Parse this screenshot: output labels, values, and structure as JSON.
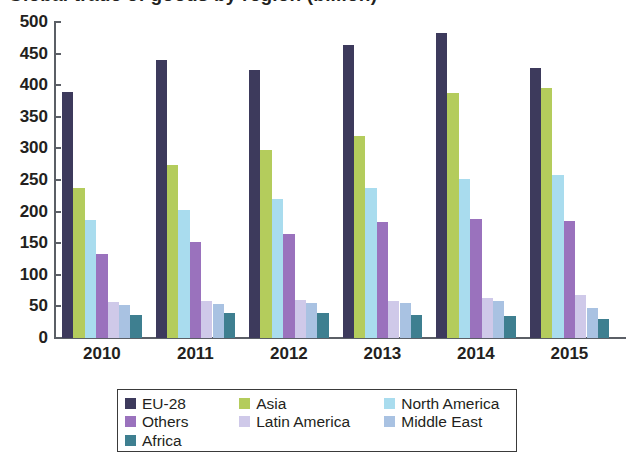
{
  "chart_data": {
    "type": "bar",
    "title": "Global trade of goods by region (billion)",
    "subtitle": "",
    "xlabel": "",
    "ylabel": "",
    "categories": [
      "2010",
      "2011",
      "2012",
      "2013",
      "2014",
      "2015"
    ],
    "ylim": [
      0,
      500
    ],
    "yticks": [
      0,
      50,
      100,
      150,
      200,
      250,
      300,
      350,
      400,
      450,
      500
    ],
    "ytick_labels": [
      "0",
      "50",
      "100",
      "150",
      "200",
      "250",
      "300",
      "350",
      "400",
      "450",
      "500"
    ],
    "grid": false,
    "legend_position": "bottom",
    "series": [
      {
        "name": "EU-28",
        "color": "#3d3a5c",
        "values": [
          390,
          440,
          424,
          463,
          482,
          428
        ]
      },
      {
        "name": "Asia",
        "color": "#b4cc5c",
        "values": [
          238,
          273,
          297,
          320,
          388,
          395
        ]
      },
      {
        "name": "North America",
        "color": "#a9dcee",
        "values": [
          186,
          202,
          220,
          238,
          252,
          258
        ]
      },
      {
        "name": "Others",
        "color": "#9a72bd",
        "values": [
          133,
          152,
          164,
          184,
          189,
          185
        ]
      },
      {
        "name": "Latin America",
        "color": "#cfc9e9",
        "values": [
          57,
          58,
          60,
          58,
          64,
          68
        ]
      },
      {
        "name": "Middle East",
        "color": "#a9c2e2",
        "values": [
          53,
          54,
          56,
          56,
          58,
          48
        ]
      },
      {
        "name": "Africa",
        "color": "#3e7f90",
        "values": [
          37,
          39,
          40,
          36,
          35,
          30
        ]
      }
    ]
  },
  "axis": {
    "y_tick_labels": [
      "500",
      "450",
      "400",
      "350",
      "300",
      "250",
      "200",
      "150",
      "100",
      "50",
      "0"
    ],
    "x_tick_labels": [
      "2010",
      "2011",
      "2012",
      "2013",
      "2014",
      "2015"
    ]
  },
  "legend": {
    "rows": [
      [
        {
          "label": "EU-28",
          "color": "#3d3a5c"
        },
        {
          "label": "Asia",
          "color": "#b4cc5c"
        },
        {
          "label": "North America",
          "color": "#a9dcee"
        }
      ],
      [
        {
          "label": "Others",
          "color": "#9a72bd"
        },
        {
          "label": "Latin America",
          "color": "#cfc9e9"
        },
        {
          "label": "Middle East",
          "color": "#a9c2e2"
        }
      ],
      [
        {
          "label": "Africa",
          "color": "#3e7f90"
        }
      ]
    ]
  }
}
